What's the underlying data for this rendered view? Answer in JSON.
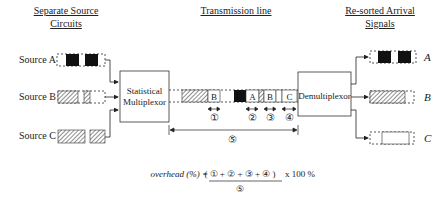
{
  "headings": {
    "left_line1": "Separate Source",
    "left_line2": "Circuits",
    "center": "Transmission line",
    "right_line1": "Re-sorted Arrival",
    "right_line2": "Signals"
  },
  "sources": [
    {
      "label": "Source A",
      "pattern": "solid-black"
    },
    {
      "label": "Source B",
      "pattern": "hatched"
    },
    {
      "label": "Source C",
      "pattern": "hatched"
    }
  ],
  "multiplexer": {
    "line1": "Statistical",
    "line2": "Multiplexor"
  },
  "demultiplexer": {
    "label": "Demultiplexor"
  },
  "frame_labels": [
    "B",
    "A",
    "B",
    "C"
  ],
  "markers": [
    "①",
    "②",
    "③",
    "④",
    "⑤"
  ],
  "outputs": [
    {
      "label": "A",
      "pattern": "solid-black"
    },
    {
      "label": "B",
      "pattern": "hatched"
    },
    {
      "label": "C",
      "pattern": "empty"
    }
  ],
  "formula": {
    "lhs": "overhead (%) =",
    "numerator": "( ① + ② + ③ + ④ )",
    "multiplier": "x 100 %",
    "denominator": "⑤"
  }
}
